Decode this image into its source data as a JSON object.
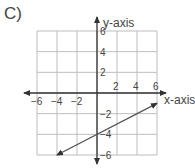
{
  "panel_label": "C)",
  "chart_data": {
    "type": "line",
    "title": "",
    "xlabel": "x-axis",
    "ylabel": "y-axis",
    "xlim": [
      -6,
      6
    ],
    "ylim": [
      -6,
      6
    ],
    "grid": true,
    "grid_step": 2,
    "x_ticks": [
      -6,
      -4,
      -2,
      2,
      4,
      6
    ],
    "y_ticks": [
      6,
      4,
      2,
      -2,
      -4,
      -6
    ],
    "x_tick_labels": [
      "−6",
      "−4",
      "−2",
      "2",
      "4",
      "6"
    ],
    "y_tick_labels": [
      "6",
      "4",
      "2",
      "−2",
      "−4",
      "−6"
    ],
    "series": [
      {
        "name": "line",
        "equation": "y = 0.5x - 4",
        "points": [
          [
            -4,
            -6
          ],
          [
            6,
            -1
          ]
        ],
        "y_intercept": -4,
        "slope": 0.5,
        "arrows_both_ends": true,
        "color": "#555555"
      }
    ]
  }
}
